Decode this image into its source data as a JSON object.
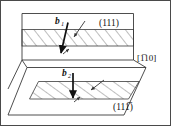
{
  "figure": {
    "background_color": "#ffffff",
    "line_color": "#3a3a3a",
    "hatch_color": "#6e6e6e",
    "arrow_color": "#111111",
    "border": {
      "name": "figure-border",
      "color": "#4a4a4a",
      "width": 1
    },
    "labels": {
      "upper_plane": "(111)",
      "lower_plane": "(111̅)",
      "lower_plane_base": "(111",
      "lower_plane_overbar": "1",
      "direction": "[1̅10]",
      "direction_overbar_char": "1",
      "direction_rest": "10",
      "direction_bracket_open": "[",
      "direction_bracket_close": "]",
      "burgers_1": "b",
      "burgers_1_sub": "1",
      "burgers_2": "b",
      "burgers_2_sub": "2"
    },
    "elements": {
      "upper_plane_name": "upper-111-plane",
      "lower_plane_name": "lower-111bar-plane",
      "upper_band_name": "upper-stacking-fault-band",
      "lower_band_name": "lower-stacking-fault-band",
      "burgers_vector_1_name": "burgers-vector-b1-arrow",
      "burgers_vector_2_name": "burgers-vector-b2-arrow",
      "partial_arrow_upper_name": "upper-partial-dislocation-arrow",
      "partial_arrow_lower_name": "lower-partial-dislocation-arrow",
      "small_arrow_upper_name": "upper-small-glide-arrow",
      "small_arrow_lower_name": "lower-small-glide-arrow"
    },
    "geometry": {
      "upper_plane_points": "22,14 133,14 133,60 22,60",
      "upper_plane_left_skew": "16,22",
      "upper_band_top_y": 30,
      "upper_band_bottom_y": 46,
      "lower_plane_points": "27,68 146,68 124,115 8,115",
      "lower_band_points": "39,82 139,82 128,99 30,99"
    }
  }
}
